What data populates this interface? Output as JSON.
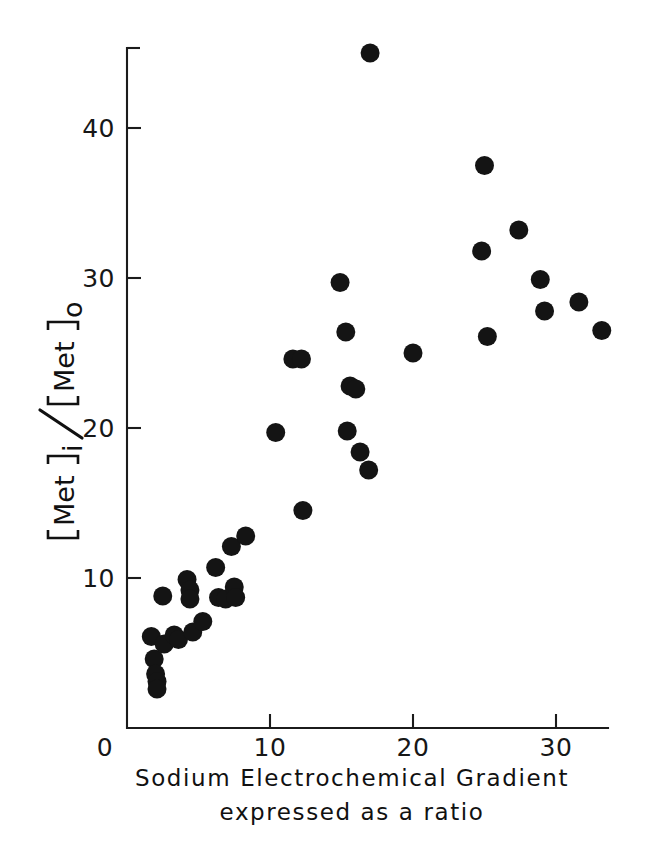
{
  "figure": {
    "background_color": "#ffffff",
    "marker_color": "#141414",
    "axis_color": "#1b1b1b"
  },
  "axes": {
    "x_title_line1": "Sodium  Electrochemical  Gradient",
    "x_title_line2": "expressed  as  a  ratio",
    "y_title_parts": {
      "numerator_open": "[",
      "numerator_text": "Met",
      "numerator_close": "]",
      "numerator_sub": "i",
      "slash": "/",
      "denominator_open": "[",
      "denominator_text": "Met",
      "denominator_close": "]",
      "denominator_sub": "o"
    },
    "x_ticks": [
      "0",
      "10",
      "20",
      "30"
    ],
    "x_tick_values": [
      0,
      10,
      20,
      30
    ],
    "y_ticks": [
      "10",
      "20",
      "30",
      "40"
    ],
    "y_tick_values": [
      10,
      20,
      30,
      40
    ]
  },
  "chart_data": {
    "type": "scatter",
    "title": "",
    "xlabel": "Sodium Electrochemical Gradient expressed as a ratio",
    "ylabel": "[Met]i / [Met]o",
    "xlim": [
      0,
      34.5
    ],
    "ylim": [
      0,
      46.5
    ],
    "grid": false,
    "legend": "none",
    "series": [
      {
        "name": "Methionine accumulation vs sodium gradient",
        "marker": "filled-circle",
        "color": "#141414",
        "points": [
          [
            1.7,
            6.1
          ],
          [
            1.9,
            4.6
          ],
          [
            2.0,
            3.6
          ],
          [
            2.1,
            3.1
          ],
          [
            2.1,
            2.6
          ],
          [
            2.5,
            8.8
          ],
          [
            2.6,
            5.6
          ],
          [
            3.3,
            6.2
          ],
          [
            3.6,
            5.9
          ],
          [
            4.2,
            9.9
          ],
          [
            4.4,
            9.2
          ],
          [
            4.4,
            8.6
          ],
          [
            4.6,
            6.4
          ],
          [
            5.3,
            7.1
          ],
          [
            6.2,
            10.7
          ],
          [
            6.4,
            8.7
          ],
          [
            6.9,
            8.6
          ],
          [
            7.3,
            12.1
          ],
          [
            7.5,
            9.4
          ],
          [
            7.6,
            8.7
          ],
          [
            8.3,
            12.8
          ],
          [
            10.4,
            19.7
          ],
          [
            11.6,
            24.6
          ],
          [
            12.2,
            24.6
          ],
          [
            12.3,
            14.5
          ],
          [
            14.9,
            29.7
          ],
          [
            15.3,
            26.4
          ],
          [
            15.4,
            19.8
          ],
          [
            15.6,
            22.8
          ],
          [
            16.0,
            22.6
          ],
          [
            16.3,
            18.4
          ],
          [
            16.9,
            17.2
          ],
          [
            17.0,
            45.0
          ],
          [
            20.0,
            25.0
          ],
          [
            24.8,
            31.8
          ],
          [
            25.0,
            37.5
          ],
          [
            25.2,
            26.1
          ],
          [
            27.4,
            33.2
          ],
          [
            28.9,
            29.9
          ],
          [
            29.2,
            27.8
          ],
          [
            31.6,
            28.4
          ],
          [
            33.2,
            26.5
          ]
        ]
      }
    ]
  }
}
